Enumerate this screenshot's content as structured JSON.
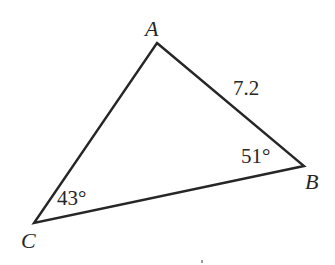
{
  "diagram": {
    "type": "triangle",
    "stroke_color": "#262626",
    "stroke_width": 2.4,
    "vertices": {
      "A": {
        "label": "A",
        "x": 157,
        "y": 43
      },
      "B": {
        "label": "B",
        "x": 304,
        "y": 166
      },
      "C": {
        "label": "C",
        "x": 34,
        "y": 223
      }
    },
    "sides": {
      "AB": {
        "length_label": "7.2"
      }
    },
    "angles": {
      "B": {
        "value_label": "51°"
      },
      "C": {
        "value_label": "43°"
      }
    }
  }
}
